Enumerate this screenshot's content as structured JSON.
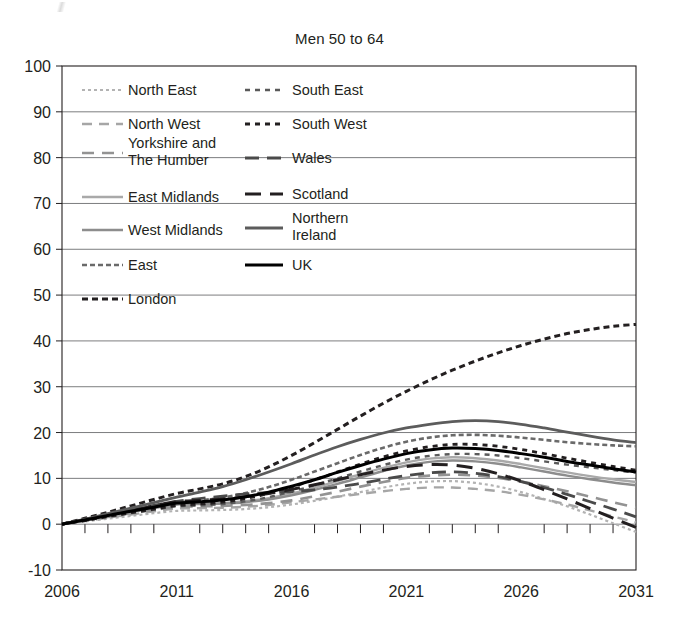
{
  "chart_data": {
    "type": "line",
    "title": "Men 50 to 64",
    "xlabel": "",
    "ylabel": "",
    "xlim": [
      2006,
      2031
    ],
    "ylim": [
      -10,
      100
    ],
    "grid": true,
    "legend_position": "inside-top-left",
    "x_ticks": [
      "2006",
      "2011",
      "2016",
      "2021",
      "2026",
      "2031"
    ],
    "x_tick_values": [
      2006,
      2011,
      2016,
      2021,
      2026,
      2031
    ],
    "x_minor_tick_interval": 1,
    "y_ticks": [
      "-10",
      "0",
      "10",
      "20",
      "30",
      "40",
      "50",
      "60",
      "70",
      "80",
      "90",
      "100"
    ],
    "y_tick_values": [
      -10,
      0,
      10,
      20,
      30,
      40,
      50,
      60,
      70,
      80,
      90,
      100
    ],
    "x": [
      2006,
      2007,
      2008,
      2009,
      2010,
      2011,
      2012,
      2013,
      2014,
      2015,
      2016,
      2017,
      2018,
      2019,
      2020,
      2021,
      2022,
      2023,
      2024,
      2025,
      2026,
      2027,
      2028,
      2029,
      2030,
      2031
    ],
    "series": [
      {
        "name": "North East",
        "dash": "3,3",
        "color": "#b3b3b3",
        "width": 2.2,
        "values": [
          0,
          0.6,
          1.2,
          1.8,
          2.4,
          2.9,
          3.0,
          3.1,
          3.3,
          3.7,
          4.3,
          5.1,
          6.0,
          7.0,
          8.0,
          8.8,
          9.3,
          9.4,
          9.0,
          8.2,
          7.0,
          5.5,
          3.9,
          2.1,
          0.2,
          -1.7
        ]
      },
      {
        "name": "North West",
        "dash": "10,7",
        "color": "#a6a6a6",
        "width": 2.4,
        "values": [
          0,
          0.7,
          1.4,
          2.1,
          2.8,
          3.4,
          3.5,
          3.6,
          3.8,
          4.2,
          4.8,
          5.4,
          6.0,
          6.6,
          7.2,
          7.7,
          8.0,
          8.0,
          7.7,
          7.2,
          6.4,
          5.4,
          4.3,
          3.0,
          1.7,
          0.4
        ]
      },
      {
        "name": "Yorkshire and The Humber",
        "dash": "12,8",
        "color": "#939393",
        "width": 2.6,
        "values": [
          0,
          0.8,
          1.6,
          2.4,
          3.1,
          3.8,
          3.9,
          4.0,
          4.2,
          4.6,
          5.2,
          6.1,
          7.1,
          8.2,
          9.2,
          10.1,
          10.6,
          10.8,
          10.6,
          10.1,
          9.3,
          8.3,
          7.2,
          6.0,
          4.8,
          3.6
        ]
      },
      {
        "name": "East Midlands",
        "dash": "none",
        "color": "#a9a9a9",
        "width": 2.4,
        "values": [
          0,
          0.9,
          1.8,
          2.7,
          3.6,
          4.4,
          4.5,
          4.6,
          5.0,
          5.7,
          6.7,
          8.0,
          9.4,
          10.9,
          12.3,
          13.5,
          14.3,
          14.6,
          14.4,
          13.9,
          13.1,
          12.2,
          11.3,
          10.5,
          9.8,
          9.2
        ]
      },
      {
        "name": "West Midlands",
        "dash": "none",
        "color": "#8d8d8d",
        "width": 2.4,
        "values": [
          0,
          0.9,
          1.8,
          2.7,
          3.5,
          4.3,
          4.4,
          4.5,
          4.8,
          5.4,
          6.3,
          7.5,
          8.8,
          10.2,
          11.6,
          12.8,
          13.6,
          13.9,
          13.7,
          13.2,
          12.4,
          11.5,
          10.6,
          9.8,
          9.1,
          8.5
        ]
      },
      {
        "name": "East",
        "dash": "5,3",
        "color": "#6a6a6a",
        "width": 2.6,
        "values": [
          0,
          1.0,
          2.0,
          3.0,
          3.9,
          4.7,
          5.2,
          5.8,
          6.8,
          8.1,
          9.7,
          11.5,
          13.3,
          15.1,
          16.7,
          18.0,
          18.9,
          19.4,
          19.5,
          19.3,
          18.9,
          18.4,
          17.9,
          17.5,
          17.2,
          17.0
        ]
      },
      {
        "name": "London",
        "dash": "6,4",
        "color": "#231f20",
        "width": 3.0,
        "values": [
          0,
          1.3,
          2.6,
          4.0,
          5.4,
          6.7,
          7.7,
          8.8,
          10.4,
          12.5,
          15.0,
          17.8,
          20.7,
          23.6,
          26.4,
          29.0,
          31.4,
          33.6,
          35.6,
          37.4,
          39.0,
          40.4,
          41.6,
          42.5,
          43.2,
          43.6
        ]
      },
      {
        "name": "South East",
        "dash": "5,5",
        "color": "#5a5a5a",
        "width": 2.4,
        "values": [
          0,
          0.8,
          1.6,
          2.4,
          3.2,
          3.9,
          4.1,
          4.4,
          5.0,
          5.9,
          7.1,
          8.5,
          10.0,
          11.5,
          12.9,
          14.1,
          14.9,
          15.3,
          15.3,
          15.0,
          14.4,
          13.7,
          13.0,
          12.4,
          11.8,
          11.3
        ]
      },
      {
        "name": "South West",
        "dash": "5,5",
        "color": "#231f20",
        "width": 2.8,
        "values": [
          0,
          0.8,
          1.7,
          2.5,
          3.3,
          4.1,
          4.4,
          4.8,
          5.6,
          6.7,
          8.1,
          9.7,
          11.4,
          13.1,
          14.7,
          16.0,
          16.9,
          17.4,
          17.4,
          17.0,
          16.3,
          15.4,
          14.4,
          13.5,
          12.6,
          11.8
        ]
      },
      {
        "name": "Wales",
        "dash": "14,8",
        "color": "#4a4a4a",
        "width": 2.8,
        "values": [
          0,
          1.0,
          2.1,
          3.1,
          4.1,
          5.0,
          5.6,
          6.1,
          6.6,
          6.9,
          7.1,
          7.5,
          8.1,
          8.9,
          9.8,
          10.6,
          11.2,
          11.4,
          11.1,
          10.4,
          9.3,
          8.0,
          6.5,
          4.9,
          3.3,
          1.6
        ]
      },
      {
        "name": "Scotland",
        "dash": "16,9",
        "color": "#231f20",
        "width": 3.0,
        "values": [
          0,
          1.0,
          2.0,
          3.0,
          4.0,
          4.9,
          5.2,
          5.5,
          6.0,
          6.7,
          7.6,
          8.6,
          9.7,
          10.8,
          11.8,
          12.6,
          13.0,
          12.9,
          12.2,
          11.0,
          9.4,
          7.5,
          5.5,
          3.4,
          1.3,
          -0.7
        ]
      },
      {
        "name": "Northern Ireland",
        "dash": "none",
        "color": "#5c5c5c",
        "width": 2.8,
        "values": [
          0,
          1.1,
          2.3,
          3.5,
          4.7,
          5.9,
          7.0,
          8.2,
          9.7,
          11.4,
          13.2,
          15.1,
          16.9,
          18.5,
          19.9,
          21.0,
          21.8,
          22.4,
          22.6,
          22.4,
          21.8,
          21.0,
          20.1,
          19.2,
          18.4,
          17.8
        ]
      },
      {
        "name": "UK",
        "dash": "none",
        "color": "#000000",
        "width": 3.0,
        "values": [
          0,
          0.9,
          1.9,
          2.8,
          3.7,
          4.6,
          4.9,
          5.3,
          6.0,
          7.0,
          8.3,
          9.7,
          11.3,
          12.8,
          14.2,
          15.4,
          16.2,
          16.6,
          16.5,
          16.1,
          15.4,
          14.6,
          13.7,
          12.9,
          12.1,
          11.4
        ]
      }
    ],
    "legend_columns": [
      [
        "North East",
        "North West",
        "Yorkshire and The Humber",
        "East Midlands",
        "West Midlands",
        "East",
        "London"
      ],
      [
        "South East",
        "South West",
        "Wales",
        "Scotland",
        "Northern Ireland",
        "UK"
      ]
    ]
  }
}
